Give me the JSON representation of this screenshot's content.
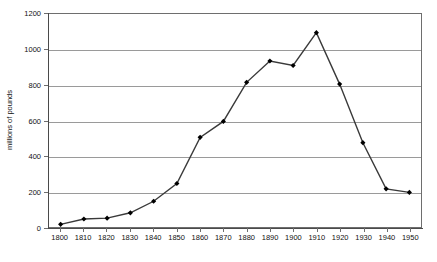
{
  "chart_data": {
    "type": "line",
    "title": "",
    "xlabel": "",
    "ylabel": "millions of pounds",
    "xlim": [
      1795,
      1955
    ],
    "ylim": [
      0,
      1200
    ],
    "grid": true,
    "legend": false,
    "marker": "diamond",
    "line_color": "#3a3a3a",
    "marker_color": "#000000",
    "grid_color": "#9a9a9a",
    "categories": [
      "1800",
      "1810",
      "1820",
      "1830",
      "1840",
      "1850",
      "1860",
      "1870",
      "1880",
      "1890",
      "1900",
      "1910",
      "1920",
      "1930",
      "1940",
      "1950"
    ],
    "x": [
      1800,
      1810,
      1820,
      1830,
      1840,
      1850,
      1860,
      1870,
      1880,
      1890,
      1900,
      1910,
      1920,
      1930,
      1940,
      1950
    ],
    "values": [
      15,
      45,
      50,
      80,
      145,
      245,
      505,
      595,
      815,
      935,
      910,
      1095,
      805,
      475,
      215,
      195
    ],
    "ytick_labels": [
      "0",
      "200",
      "400",
      "600",
      "800",
      "1000",
      "1200"
    ],
    "ytick_values": [
      0,
      200,
      400,
      600,
      800,
      1000,
      1200
    ],
    "xtick_labels": [
      "1800",
      "1810",
      "1820",
      "1830",
      "1840",
      "1850",
      "1860",
      "1870",
      "1880",
      "1890",
      "1900",
      "1910",
      "1920",
      "1930",
      "1940",
      "1950"
    ]
  }
}
